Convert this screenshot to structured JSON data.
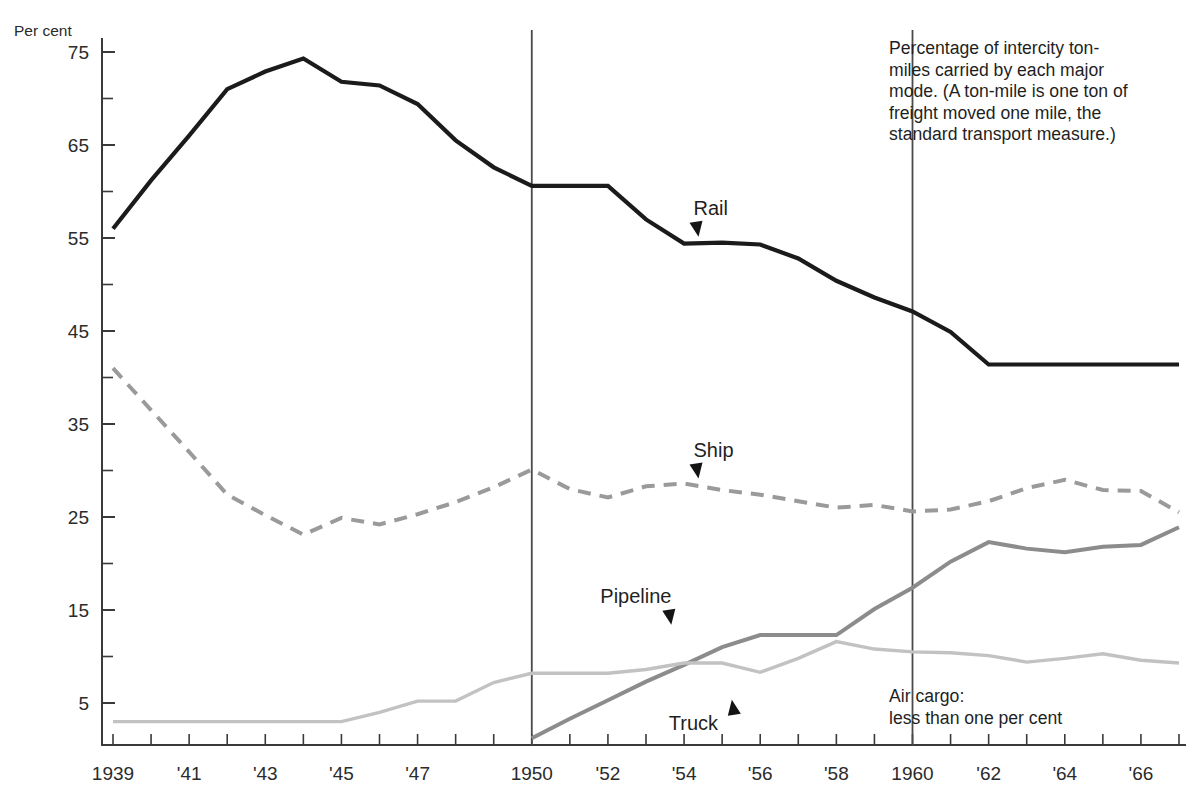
{
  "figure": {
    "y_axis_title": "Per cent",
    "description_note": "Percentage of intercity ton-\nmiles carried by each major\nmode. (A ton-mile is one ton of\nfreight moved one mile, the\nstandard transport measure.)",
    "air_cargo_note": "Air cargo:\nless than one per cent"
  },
  "chart_data": {
    "type": "line",
    "title": "",
    "subtitle": "",
    "xlabel": "",
    "ylabel": "Per cent",
    "xlim": [
      1939,
      1967
    ],
    "ylim": [
      0,
      77
    ],
    "grid": false,
    "legend_position": "inline-labels",
    "y_ticks_major": [
      75,
      65,
      55,
      45,
      35,
      25,
      15,
      5
    ],
    "y_ticks_minor": [
      70,
      60,
      50,
      40,
      30,
      20,
      10
    ],
    "y_tick_labels": [
      "75",
      "65",
      "55",
      "45",
      "35",
      "25",
      "15",
      "5"
    ],
    "x_ticks": [
      1939,
      1940,
      1941,
      1942,
      1943,
      1944,
      1945,
      1946,
      1947,
      1948,
      1949,
      1950,
      1951,
      1952,
      1953,
      1954,
      1955,
      1956,
      1957,
      1958,
      1959,
      1960,
      1961,
      1962,
      1963,
      1964,
      1965,
      1966,
      1967
    ],
    "x_tick_labels": [
      "1939",
      "",
      "'41",
      "",
      "'43",
      "",
      "'45",
      "",
      "'47",
      "",
      "",
      "1950",
      "",
      "'52",
      "",
      "'54",
      "",
      "'56",
      "",
      "'58",
      "",
      "1960",
      "",
      "'62",
      "",
      "'64",
      "",
      "'66",
      ""
    ],
    "vertical_reference_lines": [
      1950,
      1960
    ],
    "x": [
      1939,
      1940,
      1941,
      1942,
      1943,
      1944,
      1945,
      1946,
      1947,
      1948,
      1949,
      1950,
      1951,
      1952,
      1953,
      1954,
      1955,
      1956,
      1957,
      1958,
      1959,
      1960,
      1961,
      1962,
      1963,
      1964,
      1965,
      1966,
      1967
    ],
    "series": [
      {
        "name": "Rail",
        "style": "solid",
        "color": "#1b1b1b",
        "label_x": 1954.3,
        "label_y": 57.5,
        "values": [
          56.0,
          61.2,
          66.0,
          71.0,
          72.9,
          74.3,
          71.8,
          71.4,
          69.4,
          65.5,
          62.6,
          60.6,
          60.6,
          60.6,
          57.0,
          54.4,
          54.5,
          54.3,
          52.8,
          50.4,
          48.6,
          47.1,
          44.9,
          41.4,
          41.4,
          41.4,
          41.4,
          41.4,
          41.4
        ]
      },
      {
        "name": "Ship",
        "style": "dashed",
        "color": "#9a9a9a",
        "label_x": 1954.3,
        "label_y": 31.5,
        "values": [
          41.0,
          36.5,
          32.0,
          27.4,
          25.2,
          23.1,
          24.9,
          24.2,
          25.3,
          26.6,
          28.2,
          30.1,
          28.0,
          27.1,
          28.3,
          28.6,
          27.9,
          27.4,
          26.7,
          26.0,
          26.3,
          25.6,
          25.8,
          26.7,
          28.1,
          29.0,
          27.9,
          27.8,
          25.5
        ]
      },
      {
        "name": "Pipeline",
        "style": "solid",
        "color": "#8c8c8c",
        "label_x": 1951.8,
        "label_y": 16.0,
        "values": [
          null,
          null,
          null,
          null,
          null,
          null,
          null,
          null,
          null,
          null,
          null,
          1.2,
          3.3,
          5.3,
          7.3,
          9.1,
          11.0,
          12.3,
          12.3,
          12.3,
          15.1,
          17.4,
          20.2,
          22.3,
          21.6,
          21.2,
          21.8,
          22.0,
          23.9
        ]
      },
      {
        "name": "Truck",
        "style": "solid",
        "color": "#c2c2c2",
        "label_x": 1953.6,
        "label_y": 3.2,
        "values": [
          3.0,
          3.0,
          3.0,
          3.0,
          3.0,
          3.0,
          3.0,
          4.0,
          5.2,
          5.2,
          7.2,
          8.2,
          8.2,
          8.2,
          8.6,
          9.3,
          9.3,
          8.3,
          9.8,
          11.6,
          10.8,
          10.5,
          10.4,
          10.1,
          9.4,
          9.8,
          10.3,
          9.6,
          9.3
        ]
      }
    ],
    "annotations": [
      {
        "text": "Air cargo: less than one per cent",
        "x": 1960.2,
        "y": 3.6
      },
      {
        "text": "Percentage of intercity ton-miles carried by each major mode. (A ton-mile is one ton of freight moved one mile, the standard transport measure.)",
        "x": 1960.2,
        "y": 72.0
      }
    ]
  }
}
